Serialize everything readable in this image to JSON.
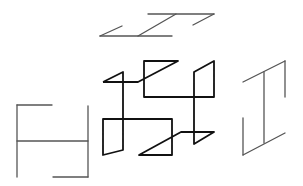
{
  "diagram": {
    "stroke_colors": {
      "projection": "#555555",
      "isometric": "#111111"
    },
    "views": [
      {
        "name": "top-view",
        "segments": [
          [
            100,
            36,
            122,
            26
          ],
          [
            100,
            36,
            172,
            36
          ],
          [
            138,
            36,
            176,
            14
          ],
          [
            148,
            14,
            214,
            14
          ],
          [
            193,
            25,
            214,
            14
          ]
        ]
      },
      {
        "name": "front-view",
        "segments": [
          [
            17,
            105,
            52,
            105
          ],
          [
            17,
            105,
            17,
            177
          ],
          [
            17,
            141,
            88,
            141
          ],
          [
            88,
            106,
            88,
            177
          ],
          [
            53,
            177,
            88,
            177
          ]
        ]
      },
      {
        "name": "side-view",
        "segments": [
          [
            243,
            82,
            285,
            61
          ],
          [
            285,
            61,
            285,
            97
          ],
          [
            264,
            72,
            264,
            143
          ],
          [
            243,
            118,
            243,
            155
          ],
          [
            243,
            155,
            285,
            133
          ]
        ]
      },
      {
        "name": "isometric-view",
        "polyline": [
          [
            103,
            82
          ],
          [
            123,
            72
          ],
          [
            123,
            155
          ],
          [
            103,
            155
          ],
          [
            103,
            119
          ],
          [
            172,
            119
          ],
          [
            172,
            155
          ],
          [
            139,
            155
          ],
          [
            181,
            132
          ],
          [
            214,
            132
          ],
          [
            194,
            144
          ],
          [
            194,
            72
          ],
          [
            214,
            61
          ],
          [
            214,
            97
          ],
          [
            144,
            97
          ],
          [
            144,
            61
          ],
          [
            178,
            61
          ],
          [
            138,
            82
          ],
          [
            103,
            82
          ]
        ]
      }
    ]
  }
}
